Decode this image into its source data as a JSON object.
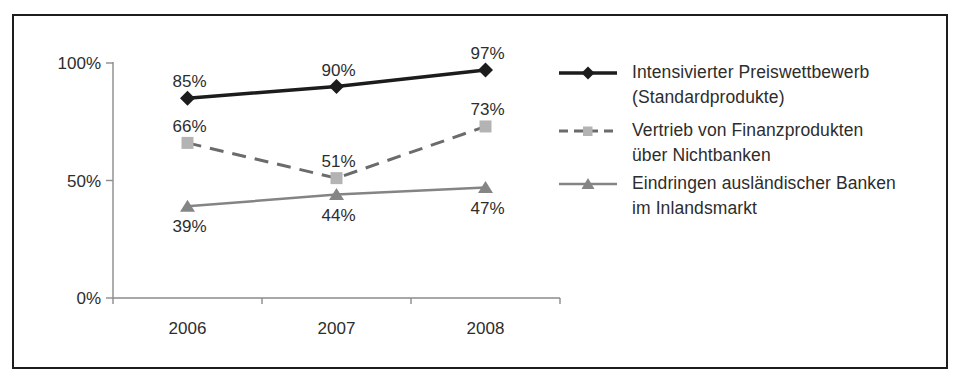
{
  "figure": {
    "background": "#ffffff",
    "border_color": "#1d1d1d"
  },
  "chart_data": {
    "type": "line",
    "categories": [
      "2006",
      "2007",
      "2008"
    ],
    "series": [
      {
        "name": "Intensivierter Preiswettbewerb (Standardprodukte)",
        "values": [
          85,
          90,
          97
        ],
        "marker": "diamond",
        "line_style": "solid",
        "line_color": "#1c1c1c",
        "marker_color": "#1c1c1c",
        "line_width": 3.5,
        "label_position": "above"
      },
      {
        "name": "Vertrieb von Finanzprodukten über Nichtbanken",
        "values": [
          66,
          51,
          73
        ],
        "marker": "square",
        "line_style": "dashed",
        "line_color": "#6b6b6b",
        "marker_color": "#b3b3b3",
        "line_width": 3,
        "label_position": "above"
      },
      {
        "name": "Eindringen ausländischer Banken im Inlandsmarkt",
        "values": [
          39,
          44,
          47
        ],
        "marker": "triangle",
        "line_style": "solid",
        "line_color": "#848484",
        "marker_color": "#858585",
        "line_width": 2.5,
        "label_position": "below"
      }
    ],
    "data_label_suffix": "%",
    "y_ticks": [
      {
        "value": 0,
        "label": "0%"
      },
      {
        "value": 50,
        "label": "50%"
      },
      {
        "value": 100,
        "label": "100%"
      }
    ],
    "ylim": [
      0,
      100
    ],
    "grid": false,
    "legend_position": "right",
    "axis_color": "#8c8c8c",
    "text_color": "#2d2d2d"
  },
  "legend": {
    "items": [
      {
        "line1": "Intensivierter Preiswettbewerb",
        "line2": "(Standardprodukte)"
      },
      {
        "line1": "Vertrieb von Finanzprodukten",
        "line2": "über Nichtbanken"
      },
      {
        "line1": "Eindringen ausländischer Banken",
        "line2": "im Inlandsmarkt"
      }
    ]
  }
}
